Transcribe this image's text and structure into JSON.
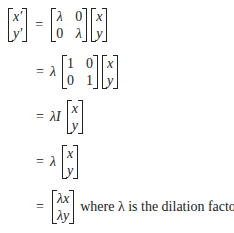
{
  "equation": {
    "lhs": {
      "col": [
        [
          "x′",
          "y′"
        ]
      ]
    },
    "steps": [
      {
        "prefix": "",
        "matrix": [
          [
            "λ",
            "0"
          ],
          [
            "0",
            "λ"
          ]
        ],
        "vector": [
          "x",
          "y"
        ]
      },
      {
        "prefix": "λ",
        "matrix": [
          [
            "1",
            "0"
          ],
          [
            "0",
            "1"
          ]
        ],
        "vector": [
          "x",
          "y"
        ]
      },
      {
        "prefix": "λI",
        "vector": [
          "x",
          "y"
        ]
      },
      {
        "prefix": "λ",
        "vector": [
          "x",
          "y"
        ]
      },
      {
        "prefix": "",
        "vector": [
          "λx",
          "λy"
        ],
        "suffix": "where λ is the dilation factor."
      }
    ],
    "equals": "="
  }
}
